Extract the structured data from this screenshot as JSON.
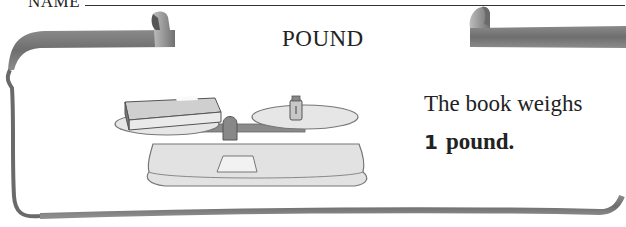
{
  "header": {
    "name_label": "NAME"
  },
  "card": {
    "title": "POUND",
    "sentence_line1": "The book weighs",
    "sentence_number": "1",
    "sentence_unit": "pound."
  },
  "illustration": {
    "description": "balance scale with a book on the left pan and a weight on the right pan"
  },
  "colors": {
    "ribbon": "#7a7a7a",
    "text": "#222222",
    "frame": "#6a6a6a"
  }
}
